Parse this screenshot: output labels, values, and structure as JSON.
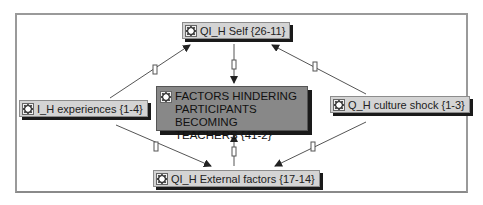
{
  "diagram": {
    "nodes": {
      "self": {
        "label": "QI_H Self {26-11}",
        "icon": "code-family-icon"
      },
      "center": {
        "label": "FACTORS HINDERING PARTICIPANTS BECOMING TEACHERS {41-2}",
        "icon": "code-family-icon"
      },
      "experiences": {
        "label": "I_H experiences {1-4}",
        "icon": "code-family-icon"
      },
      "culture_shock": {
        "label": "Q_H culture shock {1-3}",
        "icon": "code-family-icon"
      },
      "external": {
        "label": "QI_H External factors {17-14}",
        "icon": "code-family-icon"
      }
    },
    "links": [
      {
        "from": "experiences",
        "to": "self",
        "arrow": "to"
      },
      {
        "from": "culture_shock",
        "to": "self",
        "arrow": "to"
      },
      {
        "from": "self",
        "to": "center",
        "arrow": "to"
      },
      {
        "from": "external",
        "to": "center",
        "arrow": "to"
      },
      {
        "from": "experiences",
        "to": "external",
        "arrow": "to"
      },
      {
        "from": "culture_shock",
        "to": "external",
        "arrow": "to"
      }
    ],
    "colors": {
      "node_fill": "#d4d4d4",
      "center_fill": "#888888",
      "shadow": "#1a1a1a",
      "line": "#555555",
      "frame": "#9a9a9a"
    }
  }
}
